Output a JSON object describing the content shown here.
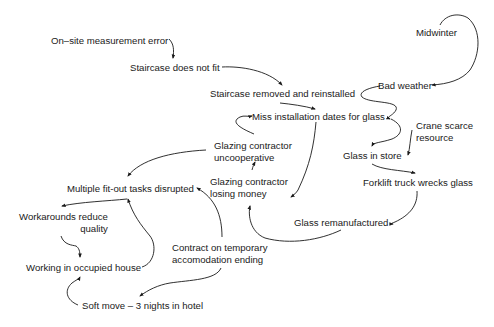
{
  "diagram": {
    "type": "causal-loop",
    "nodes": [
      {
        "id": "measurement_error",
        "label": "On–site measurement error"
      },
      {
        "id": "staircase_not_fit",
        "label": "Staircase does not fit"
      },
      {
        "id": "staircase_removed",
        "label": "Staircase removed and reinstalled"
      },
      {
        "id": "miss_dates",
        "label": "Miss installation dates for glass"
      },
      {
        "id": "glazing_uncoop",
        "line1": "Glazing contractor",
        "line2": "uncooperative"
      },
      {
        "id": "glazing_losing",
        "line1": "Glazing contractor",
        "line2": "losing money"
      },
      {
        "id": "multiple_tasks",
        "label": "Multiple fit-out tasks disrupted"
      },
      {
        "id": "workarounds",
        "line1": "Workarounds reduce",
        "line2": "quality"
      },
      {
        "id": "working_occupied",
        "label": "Working in occupied house"
      },
      {
        "id": "contract_ending",
        "line1": "Contract on temporary",
        "line2": "accomodation ending"
      },
      {
        "id": "soft_move",
        "label": "Soft move – 3 nights in hotel"
      },
      {
        "id": "midwinter",
        "label": "Midwinter"
      },
      {
        "id": "bad_weather",
        "label": "Bad weather"
      },
      {
        "id": "crane",
        "line1": "Crane scarce",
        "line2": "resource"
      },
      {
        "id": "glass_store",
        "label": "Glass in store"
      },
      {
        "id": "forklift",
        "label": "Forklift truck wrecks glass"
      },
      {
        "id": "glass_reman",
        "label": "Glass remanufactured"
      }
    ],
    "edges": [
      {
        "from": "measurement_error",
        "to": "staircase_not_fit"
      },
      {
        "from": "staircase_not_fit",
        "to": "staircase_removed"
      },
      {
        "from": "staircase_removed",
        "to": "miss_dates"
      },
      {
        "from": "miss_dates",
        "to": "glazing_losing"
      },
      {
        "from": "glazing_uncoop",
        "to": "miss_dates"
      },
      {
        "from": "glazing_uncoop",
        "to": "multiple_tasks"
      },
      {
        "from": "glazing_losing",
        "to": "glazing_uncoop"
      },
      {
        "from": "multiple_tasks",
        "to": "workarounds"
      },
      {
        "from": "working_occupied",
        "to": "multiple_tasks"
      },
      {
        "from": "workarounds",
        "to": "working_occupied"
      },
      {
        "from": "contract_ending",
        "to": "multiple_tasks"
      },
      {
        "from": "contract_ending",
        "to": "soft_move"
      },
      {
        "from": "soft_move",
        "to": "working_occupied"
      },
      {
        "from": "midwinter",
        "to": "bad_weather"
      },
      {
        "from": "bad_weather",
        "to": "miss_dates"
      },
      {
        "from": "miss_dates",
        "to": "glass_store"
      },
      {
        "from": "crane",
        "to": "glass_store"
      },
      {
        "from": "glass_store",
        "to": "forklift"
      },
      {
        "from": "forklift",
        "to": "glass_reman"
      },
      {
        "from": "glass_reman",
        "to": "glazing_losing"
      }
    ]
  }
}
